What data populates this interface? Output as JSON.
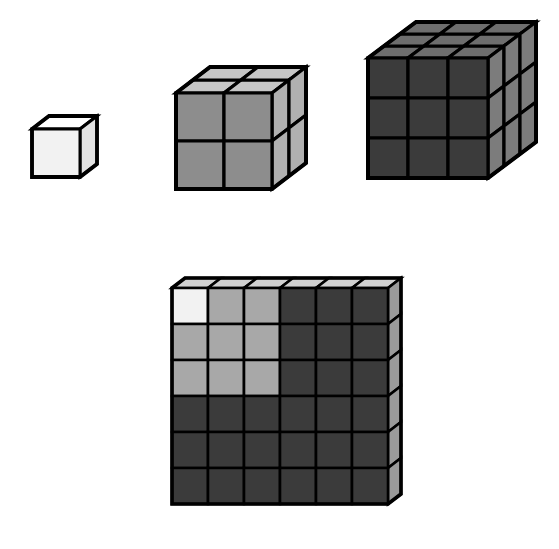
{
  "figure": {
    "background": "#ffffff",
    "stroke_color": "#000000",
    "canvas": {
      "width": 559,
      "height": 549
    }
  },
  "palette": {
    "white": "#f2f2f2",
    "white_top": "#ffffff",
    "white_side": "#e2e2e2",
    "light_gray": "#a8a8a8",
    "light_gray_top": "#c6c6c6",
    "light_gray_side": "#bdbdbd",
    "mid_gray": "#8d8d8d",
    "dark_gray": "#3b3b3b",
    "dark_gray_top": "#6e6e6e",
    "dark_gray_side": "#7c7c7c",
    "darkest_gray": "#333333",
    "outline": "#000000"
  },
  "chart_data": {
    "type": "diagram",
    "identity": "1^3 + 2^3 + 3^3 = (1+2+3)^2 = 6^2 = 36",
    "top_row": {
      "label": "Stacked cubes",
      "cubes": [
        {
          "name": "cube-1",
          "edge": 1,
          "unit_cubes": 1,
          "front_color": "#f2f2f2",
          "top_color": "#ffffff",
          "side_color": "#e2e2e2"
        },
        {
          "name": "cube-2",
          "edge": 2,
          "unit_cubes": 8,
          "front_color": "#8d8d8d",
          "top_color": "#c6c6c6",
          "side_color": "#b0b0b0"
        },
        {
          "name": "cube-3",
          "edge": 3,
          "unit_cubes": 27,
          "front_color": "#3b3b3b",
          "top_color": "#6e6e6e",
          "side_color": "#7c7c7c"
        }
      ]
    },
    "bottom_slab": {
      "label": "6 by 6 square slab",
      "rows": 6,
      "cols": 6,
      "total_cells": 36,
      "front_color": "#333333",
      "top_color": "#d0d0d0",
      "side_color": "#9a9a9a",
      "regions": [
        {
          "name": "region-1",
          "from_cube_edge": 1,
          "cells": 1,
          "color": "#f2f2f2"
        },
        {
          "name": "region-2",
          "from_cube_edge": 2,
          "cells": 8,
          "color": "#a8a8a8"
        },
        {
          "name": "region-3",
          "from_cube_edge": 3,
          "cells": 27,
          "color": "#3b3b3b"
        }
      ],
      "cell_colors": [
        [
          "#f2f2f2",
          "#a8a8a8",
          "#a8a8a8",
          "#3b3b3b",
          "#3b3b3b",
          "#3b3b3b"
        ],
        [
          "#a8a8a8",
          "#a8a8a8",
          "#a8a8a8",
          "#3b3b3b",
          "#3b3b3b",
          "#3b3b3b"
        ],
        [
          "#a8a8a8",
          "#a8a8a8",
          "#a8a8a8",
          "#3b3b3b",
          "#3b3b3b",
          "#3b3b3b"
        ],
        [
          "#3b3b3b",
          "#3b3b3b",
          "#3b3b3b",
          "#3b3b3b",
          "#3b3b3b",
          "#3b3b3b"
        ],
        [
          "#3b3b3b",
          "#3b3b3b",
          "#3b3b3b",
          "#3b3b3b",
          "#3b3b3b",
          "#3b3b3b"
        ],
        [
          "#3b3b3b",
          "#3b3b3b",
          "#3b3b3b",
          "#3b3b3b",
          "#3b3b3b",
          "#3b3b3b"
        ]
      ]
    }
  },
  "geometry": {
    "cube1": {
      "x": 32,
      "y": 129,
      "cell": 48,
      "n": 1,
      "dx": 17,
      "dy": -13,
      "stroke": 3
    },
    "cube2": {
      "x": 176,
      "y": 93,
      "cell": 48,
      "n": 2,
      "dx": 17,
      "dy": -13,
      "stroke": 3.2
    },
    "cube3": {
      "x": 368,
      "y": 58,
      "cell": 40,
      "n": 3,
      "dx": 16,
      "dy": -12,
      "stroke": 3.2
    },
    "slab": {
      "x": 172,
      "y": 288,
      "cell": 36,
      "n": 6,
      "dx": 13,
      "dy": -10,
      "stroke": 2.6
    }
  }
}
